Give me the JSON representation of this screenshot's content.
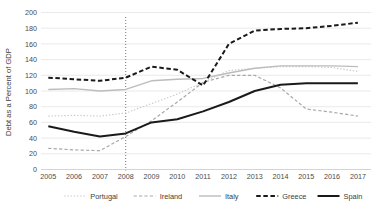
{
  "chart_data": {
    "type": "line",
    "title": "",
    "xlabel": "",
    "ylabel": "Debt as a Percent of GDP",
    "x": [
      2005,
      2006,
      2007,
      2008,
      2009,
      2010,
      2011,
      2012,
      2013,
      2014,
      2015,
      2016,
      2017
    ],
    "xtick_labels": [
      "2005",
      "2006",
      "2007",
      "2008",
      "2009",
      "2010",
      "2011",
      "2012",
      "2013",
      "2014",
      "2015",
      "2016",
      "2017"
    ],
    "ytick_labels": [
      "0",
      "20",
      "40",
      "60",
      "80",
      "100",
      "120",
      "140",
      "160",
      "180",
      "200"
    ],
    "yticks": [
      0,
      20,
      40,
      60,
      80,
      100,
      120,
      140,
      160,
      180,
      200
    ],
    "ylim": [
      0,
      200
    ],
    "xlim": [
      2005,
      2017
    ],
    "grid": "horizontal",
    "legend_position": "bottom",
    "annotation_line": {
      "name": "crisis-marker-2008",
      "x": 2008,
      "style": "dotted"
    },
    "series": [
      {
        "name": "Portugal",
        "color": "#c8c8c8",
        "style": "dotted",
        "width": 1.1,
        "values": [
          68,
          69,
          68,
          72,
          84,
          96,
          111,
          126,
          129,
          131,
          131,
          130,
          125
        ]
      },
      {
        "name": "Ireland",
        "color": "#a8a8a8",
        "style": "dashed",
        "width": 1.2,
        "values": [
          27,
          25,
          24,
          42,
          62,
          86,
          111,
          120,
          120,
          104,
          77,
          73,
          68
        ]
      },
      {
        "name": "Italy",
        "color": "#bcbcbc",
        "style": "solid",
        "width": 1.4,
        "values": [
          102,
          103,
          100,
          102,
          113,
          115,
          116,
          123,
          129,
          132,
          132,
          132,
          131
        ]
      },
      {
        "name": "Greece",
        "color": "#1a1a1a",
        "style": "dashed",
        "width": 2.0,
        "values": [
          117,
          115,
          113,
          117,
          131,
          127,
          107,
          160,
          177,
          179,
          180,
          183,
          187
        ]
      },
      {
        "name": "Spain",
        "color": "#1a1a1a",
        "style": "solid",
        "width": 2.0,
        "values": [
          55,
          48,
          42,
          46,
          60,
          64,
          74,
          86,
          100,
          108,
          110,
          110,
          110
        ]
      }
    ]
  },
  "legend": {
    "items": [
      {
        "label": "Portugal"
      },
      {
        "label": "Ireland"
      },
      {
        "label": "Italy"
      },
      {
        "label": "Greece"
      },
      {
        "label": "Spain"
      }
    ]
  }
}
